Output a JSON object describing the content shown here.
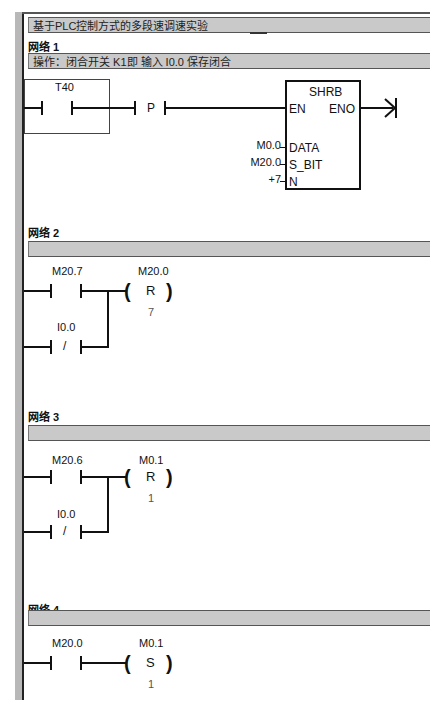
{
  "program": {
    "title": "基于PLC控制方式的多段速调速实验"
  },
  "networks": [
    {
      "title": "网络 1",
      "comment": "操作：闭合开关 K1即 输入 I0.0 保存闭合",
      "contacts": [
        {
          "address": "T40",
          "type": "NO"
        },
        {
          "address": "P",
          "type": "positive-transition"
        }
      ],
      "box": {
        "name": "SHRB",
        "pins": {
          "en": "EN",
          "eno": "ENO",
          "data": "DATA",
          "s_bit": "S_BIT",
          "n": "N"
        },
        "params": {
          "data": "M0.0",
          "s_bit": "M20.0",
          "n": "+7"
        }
      }
    },
    {
      "title": "网络 2",
      "comment": "",
      "contacts": [
        {
          "address": "M20.7",
          "type": "NO"
        },
        {
          "address": "I0.0",
          "type": "NC",
          "symbol": "/"
        }
      ],
      "coil": {
        "address": "M20.0",
        "op": "R",
        "count": "7"
      }
    },
    {
      "title": "网络 3",
      "comment": "",
      "contacts": [
        {
          "address": "M20.6",
          "type": "NO"
        },
        {
          "address": "I0.0",
          "type": "NC",
          "symbol": "/"
        }
      ],
      "coil": {
        "address": "M0.1",
        "op": "R",
        "count": "1"
      }
    },
    {
      "title": "网络 4",
      "comment": "",
      "contacts": [
        {
          "address": "M20.0",
          "type": "NO"
        }
      ],
      "coil": {
        "address": "M0.1",
        "op": "S",
        "count": "1"
      }
    }
  ],
  "colors": {
    "header_bar": "#c9c9c9",
    "rail": "#222222",
    "left_strip": "#b8b8b8"
  }
}
